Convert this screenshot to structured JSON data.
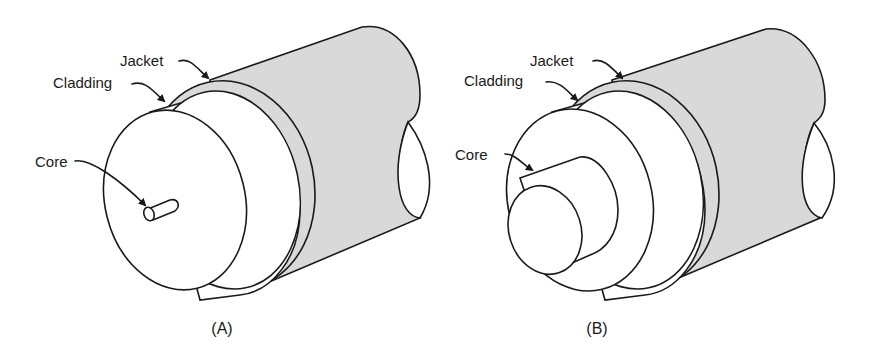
{
  "figure": {
    "panels": [
      {
        "id": "A",
        "caption": "(A)",
        "labels": {
          "jacket": "Jacket",
          "cladding": "Cladding",
          "core": "Core"
        },
        "description": "Fiber with thin core"
      },
      {
        "id": "B",
        "caption": "(B)",
        "labels": {
          "jacket": "Jacket",
          "cladding": "Cladding",
          "core": "Core"
        },
        "description": "Fiber with large core"
      }
    ],
    "colors": {
      "jacket_fill": "#d9d9d9",
      "line": "#1a1a1a",
      "background": "#ffffff"
    }
  }
}
